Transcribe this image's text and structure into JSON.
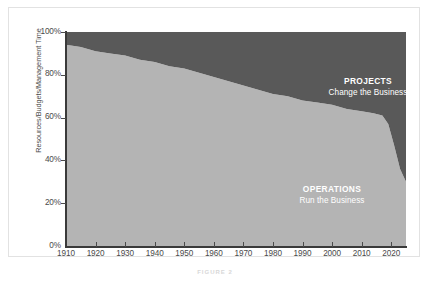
{
  "chart_data": {
    "type": "area",
    "stacked": true,
    "normalized": true,
    "title": "",
    "xlabel": "",
    "ylabel": "Resources/Budgets/Management Time",
    "xlim": [
      1910,
      2025
    ],
    "ylim": [
      0,
      100
    ],
    "grid": false,
    "legend_position": "in-plot-annotations",
    "x_tick_labels": [
      "1910",
      "1920",
      "1930",
      "1940",
      "1950",
      "1960",
      "1970",
      "1980",
      "1990",
      "2000",
      "2010",
      "2020"
    ],
    "x_ticks": [
      1910,
      1920,
      1930,
      1940,
      1950,
      1960,
      1970,
      1980,
      1990,
      2000,
      2010,
      2020
    ],
    "y_tick_labels": [
      "0%",
      "20%",
      "40%",
      "60%",
      "80%",
      "100%"
    ],
    "y_ticks": [
      0,
      20,
      40,
      60,
      80,
      100
    ],
    "x": [
      1910,
      1915,
      1920,
      1925,
      1930,
      1935,
      1940,
      1945,
      1950,
      1955,
      1960,
      1965,
      1970,
      1975,
      1980,
      1985,
      1990,
      1995,
      2000,
      2005,
      2010,
      2014,
      2017,
      2019,
      2021,
      2023,
      2025
    ],
    "series": [
      {
        "name": "OPERATIONS",
        "subtitle": "Run the Business",
        "color": "#b4b4b4",
        "values": [
          94,
          93,
          91,
          90,
          89,
          87,
          86,
          84,
          83,
          81,
          79,
          77,
          75,
          73,
          71,
          70,
          68,
          67,
          66,
          64,
          63,
          62,
          61,
          57,
          47,
          36,
          30
        ]
      },
      {
        "name": "PROJECTS",
        "subtitle": "Change the Business",
        "color": "#595959",
        "values": [
          6,
          7,
          9,
          10,
          11,
          13,
          14,
          16,
          17,
          19,
          21,
          23,
          25,
          27,
          29,
          30,
          32,
          33,
          34,
          36,
          37,
          38,
          39,
          43,
          53,
          64,
          70
        ]
      }
    ],
    "annotations": [
      {
        "title": "PROJECTS",
        "subtitle": "Change the Business",
        "area": "top"
      },
      {
        "title": "OPERATIONS",
        "subtitle": "Run the Business",
        "area": "bottom"
      }
    ]
  },
  "figure": {
    "caption": "FIGURE 2"
  },
  "colors": {
    "projects": "#595959",
    "operations": "#b4b4b4",
    "axis": "#4a4a4a",
    "frame": "#e2e2e2",
    "annotation_text": "#ffffff"
  }
}
